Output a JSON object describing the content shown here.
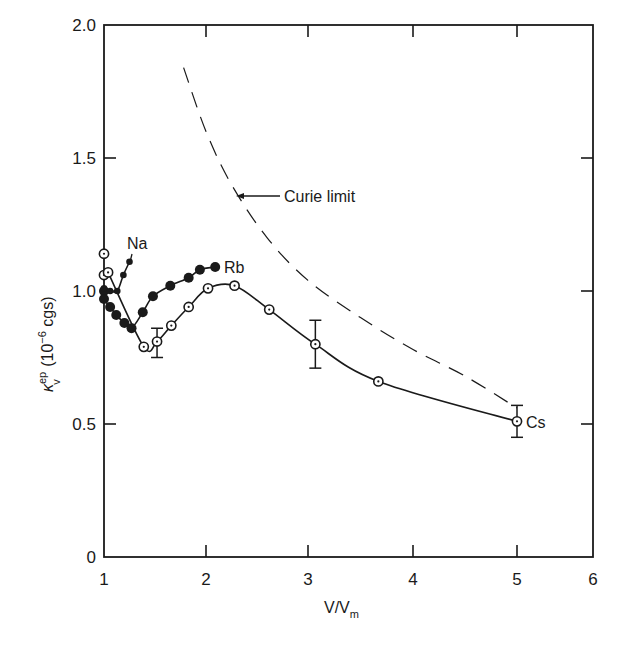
{
  "chart_data": {
    "type": "line",
    "title": "",
    "xlabel": "V/V_m",
    "xlabel_main": "V/V",
    "xlabel_sub": "m",
    "ylabel": "κ_v^ep (10^-6 cgs)",
    "ylabel_kappa": "κ",
    "ylabel_sup": "ep",
    "ylabel_sub": "v",
    "ylabel_units": "(10",
    "ylabel_exp": "−6",
    "ylabel_units_end": "cgs)",
    "xlim": [
      1,
      6
    ],
    "ylim": [
      0,
      2.0
    ],
    "grid": false,
    "x_ticks": [
      {
        "value": 1,
        "label": "1",
        "px": 104
      },
      {
        "value": 2,
        "label": "2",
        "px": 206
      },
      {
        "value": 3,
        "label": "3",
        "px": 308
      },
      {
        "value": 4,
        "label": "4",
        "px": 413
      },
      {
        "value": 5,
        "label": "5",
        "px": 517
      },
      {
        "value": 6,
        "label": "6",
        "px": 593
      }
    ],
    "y_ticks": [
      {
        "value": 0,
        "label": "0"
      },
      {
        "value": 0.5,
        "label": "0.5"
      },
      {
        "value": 1.0,
        "label": "1.0"
      },
      {
        "value": 1.5,
        "label": "1.5"
      },
      {
        "value": 2.0,
        "label": "2.0"
      }
    ],
    "series": [
      {
        "name": "Cs",
        "marker": "open-circle-dot",
        "line": "solid",
        "x": [
          1.0,
          1.0,
          1.04,
          1.39,
          1.52,
          1.66,
          1.83,
          2.02,
          2.28,
          2.62,
          3.07,
          3.67,
          5.0
        ],
        "y": [
          1.14,
          1.06,
          1.07,
          0.79,
          0.81,
          0.87,
          0.94,
          1.01,
          1.02,
          0.93,
          0.8,
          0.66,
          0.51
        ],
        "error_bars": [
          {
            "x": 1.52,
            "low": 0.75,
            "high": 0.86
          },
          {
            "x": 3.07,
            "low": 0.71,
            "high": 0.89
          },
          {
            "x": 5.0,
            "low": 0.45,
            "high": 0.57
          }
        ]
      },
      {
        "name": "Rb",
        "marker": "filled-circle",
        "line": "solid",
        "x": [
          1.0,
          1.0,
          1.06,
          1.12,
          1.2,
          1.27,
          1.38,
          1.48,
          1.65,
          1.83,
          1.94,
          2.09
        ],
        "y": [
          1.0,
          0.97,
          0.94,
          0.91,
          0.88,
          0.86,
          0.92,
          0.98,
          1.02,
          1.05,
          1.08,
          1.09
        ]
      },
      {
        "name": "Na",
        "marker": "small-filled",
        "line": "solid",
        "x": [
          1.0,
          1.06,
          1.13,
          1.19,
          1.25
        ],
        "y": [
          1.01,
          1.0,
          1.0,
          1.06,
          1.11
        ]
      },
      {
        "name": "Curie limit",
        "marker": "none",
        "line": "dashed",
        "x": [
          1.78,
          2.0,
          2.25,
          2.6,
          3.0,
          3.5,
          4.0,
          4.5,
          5.0
        ],
        "y": [
          1.84,
          1.6,
          1.4,
          1.2,
          1.04,
          0.9,
          0.78,
          0.68,
          0.56
        ]
      }
    ],
    "annotations": [
      {
        "text": "Curie limit",
        "arrow": true,
        "points_to": "dashed Curie line near x≈2.3, y≈1.36"
      },
      {
        "text": "Na",
        "points_to": "Na series end"
      },
      {
        "text": "Rb",
        "points_to": "Rb series end"
      },
      {
        "text": "Cs",
        "points_to": "Cs series end"
      }
    ]
  },
  "labels": {
    "curie": "Curie limit",
    "na": "Na",
    "rb": "Rb",
    "cs": "Cs"
  }
}
